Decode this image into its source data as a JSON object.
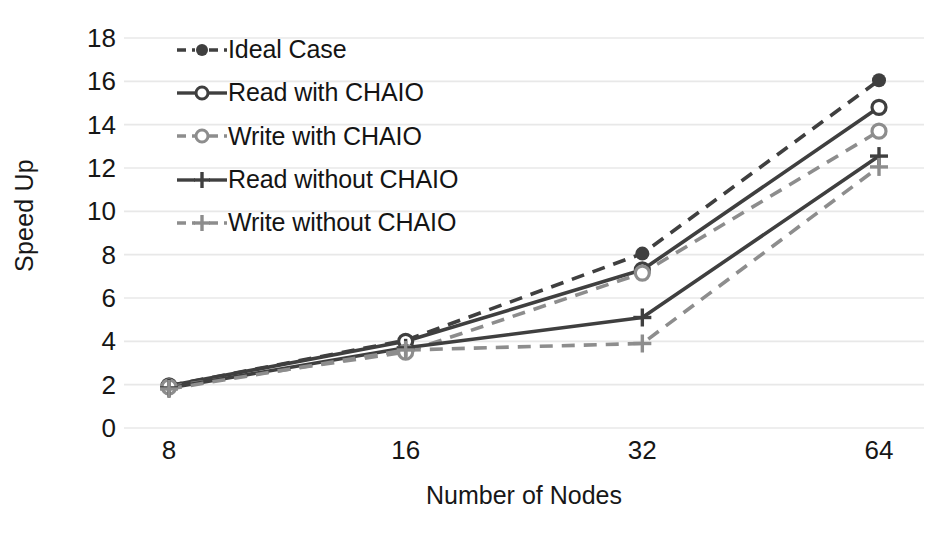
{
  "chart_data": {
    "type": "line",
    "title": "",
    "xlabel": "Number of Nodes",
    "ylabel": "Speed Up",
    "categories": [
      "8",
      "16",
      "32",
      "64"
    ],
    "x": [
      8,
      16,
      32,
      64
    ],
    "ylim": [
      0,
      18
    ],
    "yticks": [
      0,
      2,
      4,
      6,
      8,
      10,
      12,
      14,
      16,
      18
    ],
    "grid": "horizontal",
    "legend_position": "inside-upper-left",
    "series": [
      {
        "name": "Ideal Case",
        "values": [
          1.95,
          4.05,
          8.05,
          16.05
        ],
        "color": "#3f3f3f",
        "dash": "dashed",
        "marker": "filled-circle"
      },
      {
        "name": "Read with CHAIO",
        "values": [
          1.95,
          4.0,
          7.3,
          14.8
        ],
        "color": "#3f3f3f",
        "dash": "solid",
        "marker": "open-circle"
      },
      {
        "name": "Write with CHAIO",
        "values": [
          1.9,
          3.5,
          7.15,
          13.7
        ],
        "color": "#8d8d8d",
        "dash": "dashed",
        "marker": "open-circle"
      },
      {
        "name": "Read without CHAIO",
        "values": [
          1.85,
          3.7,
          5.1,
          12.55
        ],
        "color": "#3f3f3f",
        "dash": "solid",
        "marker": "plus"
      },
      {
        "name": "Write without CHAIO",
        "values": [
          1.8,
          3.6,
          3.9,
          12.05
        ],
        "color": "#8d8d8d",
        "dash": "dashed",
        "marker": "plus"
      }
    ]
  },
  "axes": {
    "y_title": "Speed Up",
    "x_title": "Number of Nodes",
    "y_tick_labels": [
      "18",
      "16",
      "14",
      "12",
      "10",
      "8",
      "6",
      "4",
      "2",
      "0"
    ],
    "x_tick_labels": [
      "8",
      "16",
      "32",
      "64"
    ]
  },
  "legend": {
    "items": [
      {
        "label": "Ideal Case"
      },
      {
        "label": "Read with CHAIO"
      },
      {
        "label": "Write with CHAIO"
      },
      {
        "label": "Read without CHAIO"
      },
      {
        "label": "Write without CHAIO"
      }
    ]
  },
  "style": {
    "gridline_color": "#e8e8e8",
    "dark_series_color": "#3f3f3f",
    "light_series_color": "#8d8d8d",
    "text_color": "#161616",
    "background": "#ffffff"
  }
}
